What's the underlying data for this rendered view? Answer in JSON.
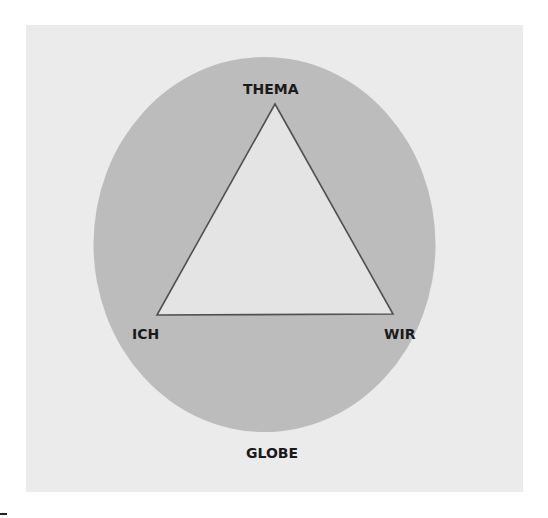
{
  "diagram": {
    "type": "tzi-triangle-in-globe",
    "labels": {
      "top": "THEMA",
      "left": "ICH",
      "right": "WIR",
      "bottom": "GLOBE"
    },
    "colors": {
      "background": "#ebebeb",
      "globe": "#bcbcbc",
      "triangle_fill": "#e4e4e4",
      "triangle_stroke": "#505050",
      "text": "#1a1a1a"
    }
  }
}
